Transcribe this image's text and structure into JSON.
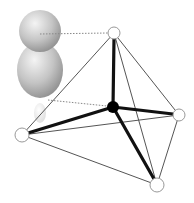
{
  "diagram": {
    "type": "tetrahedral-orbital-geometry",
    "colors": {
      "background": "#ffffff",
      "bond_thick": "#111111",
      "edge_thin": "#555555",
      "central_atom": "#000000",
      "vertex_fill": "#ffffff",
      "vertex_stroke": "#999999",
      "orbital_light": "#f2f2f2",
      "orbital_dark": "#8a8a8a",
      "guide_dotted": "#888888"
    },
    "central_atom": {
      "x": 113,
      "y": 107,
      "r": 6
    },
    "vertices": [
      {
        "id": "top",
        "x": 114,
        "y": 33,
        "r": 6
      },
      {
        "id": "left",
        "x": 22,
        "y": 135,
        "r": 7
      },
      {
        "id": "right",
        "x": 179,
        "y": 115,
        "r": 6
      },
      {
        "id": "bottom",
        "x": 157,
        "y": 185,
        "r": 7
      }
    ],
    "orbital": {
      "upper_lobe": {
        "cx": 40,
        "cy": 31,
        "r": 21
      },
      "lower_lobe": {
        "cx": 40,
        "cy": 70,
        "rx": 23,
        "ry": 28
      },
      "small_lobe": {
        "cx": 40,
        "cy": 113,
        "rx": 6,
        "ry": 10
      }
    }
  }
}
